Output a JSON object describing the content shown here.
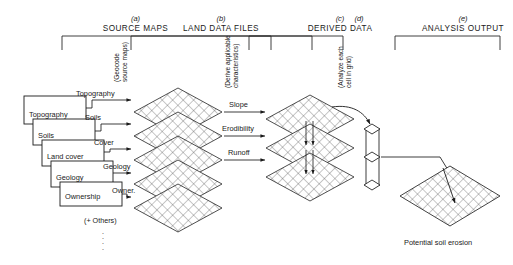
{
  "figure": {
    "columns": [
      {
        "letter": "(a)",
        "name": "SOURCE MAPS"
      },
      {
        "letter": "(b)",
        "name": "LAND DATA FILES"
      },
      {
        "letter": "(c)",
        "name": "DERIVED DATA"
      },
      {
        "letter": "(d)",
        "name": ""
      },
      {
        "letter": "(e)",
        "name": "ANALYSIS OUTPUT"
      }
    ],
    "process_labels": [
      {
        "line1": "(Geocode",
        "line2": "source maps)"
      },
      {
        "line1": "(Derive applicable",
        "line2": "characteristics)"
      },
      {
        "line1": "(Analyze each",
        "line2": "cell in grid)"
      }
    ],
    "source_maps": [
      {
        "label": "Topography"
      },
      {
        "label": "Soils"
      },
      {
        "label": "Land cover"
      },
      {
        "label": "Geology"
      },
      {
        "label": "Ownership"
      }
    ],
    "geocode_flows": [
      {
        "label": "Topography"
      },
      {
        "label": "Soils"
      },
      {
        "label": "Cover"
      },
      {
        "label": "Geology"
      },
      {
        "label": "Owner."
      }
    ],
    "others_note": "(+ Others)",
    "derived_flows": [
      {
        "label": "Slope"
      },
      {
        "label": "Erodibility"
      },
      {
        "label": "Runoff"
      }
    ],
    "output_caption": "Potential soil erosion",
    "colors": {
      "ink": "#1a1a1a",
      "grid_line": "#3c3c3c",
      "rule": "#2b2b2b"
    }
  }
}
